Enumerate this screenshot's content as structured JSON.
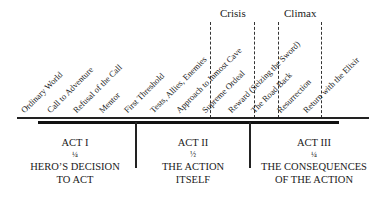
{
  "peaks": [
    {
      "label": "Crisis",
      "x": 232
    },
    {
      "label": "Climax",
      "x": 299
    }
  ],
  "stages": [
    {
      "label": "Ordinary World",
      "x": 28
    },
    {
      "label": "Call to Adventure",
      "x": 54
    },
    {
      "label": "Refusal of the Call",
      "x": 80
    },
    {
      "label": "Mentor",
      "x": 106
    },
    {
      "label": "First Threshold",
      "x": 131
    },
    {
      "label": "Tests, Allies, Enemies",
      "x": 157
    },
    {
      "label": "Approach to Inmost Cave",
      "x": 183
    },
    {
      "label": "Supreme Ordeal",
      "x": 209
    },
    {
      "label": "Reward (Seizing the Sword)",
      "x": 235
    },
    {
      "label": "The Road Back",
      "x": 258
    },
    {
      "label": "Resurrection",
      "x": 284
    },
    {
      "label": "Return with the Elixir",
      "x": 310
    }
  ],
  "acts": [
    {
      "title": "ACT I",
      "fraction": "¼",
      "line1": "HERO’S DECISION",
      "line2": "TO ACT"
    },
    {
      "title": "ACT II",
      "fraction": "½",
      "line1": "THE ACTION",
      "line2": "ITSELF"
    },
    {
      "title": "ACT III",
      "fraction": "¼",
      "line1": "THE CONSEQUENCES",
      "line2": "OF THE ACTION"
    }
  ]
}
